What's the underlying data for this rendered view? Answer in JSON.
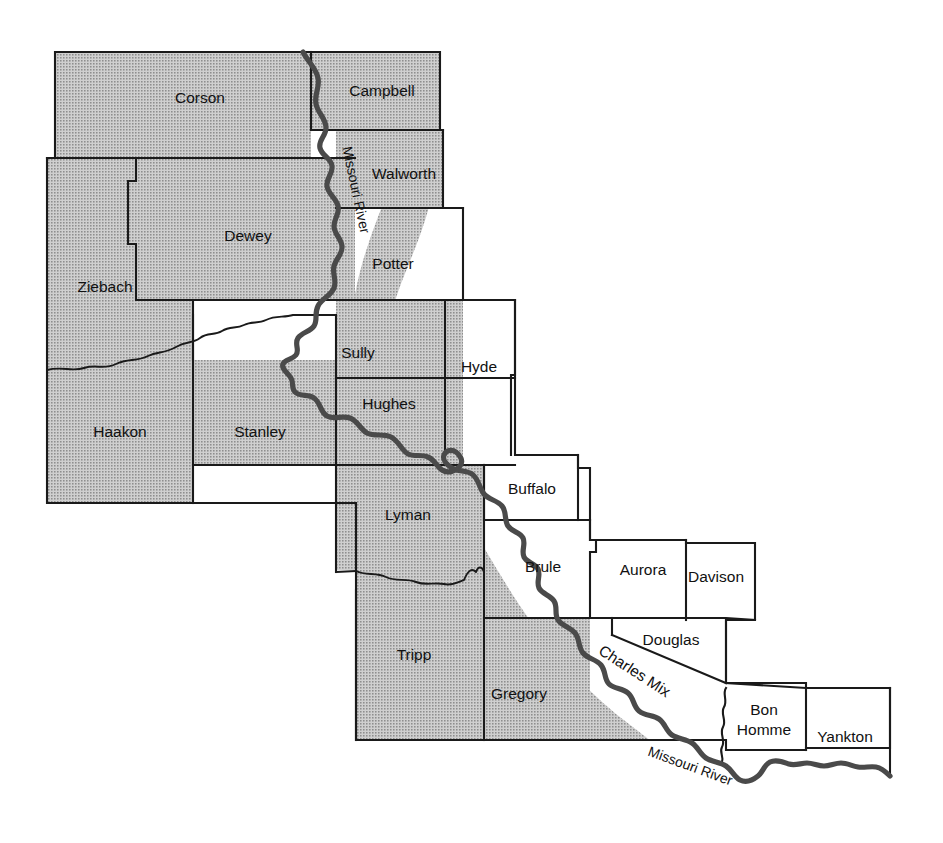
{
  "map": {
    "title": "Missouri River counties of South Dakota",
    "background_color": "#ffffff",
    "outline_color": "#1a1a1a",
    "shaded_region_color": "#b0b0b0",
    "river_color": "#4a4a4a",
    "shaded_region_name": "shaded study area",
    "counties": [
      {
        "id": "corson",
        "label": "Corson",
        "shaded": true,
        "x": 200,
        "y": 99
      },
      {
        "id": "campbell",
        "label": "Campbell",
        "shaded": true,
        "x": 382,
        "y": 92
      },
      {
        "id": "walworth",
        "label": "Walworth",
        "shaded": true,
        "x": 404,
        "y": 175
      },
      {
        "id": "dewey",
        "label": "Dewey",
        "shaded": true,
        "x": 248,
        "y": 237
      },
      {
        "id": "ziebach",
        "label": "Ziebach",
        "shaded": true,
        "x": 105,
        "y": 288
      },
      {
        "id": "potter",
        "label": "Potter",
        "shaded": false,
        "x": 393,
        "y": 265
      },
      {
        "id": "sully",
        "label": "Sully",
        "shaded": true,
        "x": 358,
        "y": 354
      },
      {
        "id": "hyde",
        "label": "Hyde",
        "shaded": false,
        "x": 479,
        "y": 368
      },
      {
        "id": "hughes",
        "label": "Hughes",
        "shaded": true,
        "x": 389,
        "y": 405
      },
      {
        "id": "haakon",
        "label": "Haakon",
        "shaded": true,
        "x": 120,
        "y": 433
      },
      {
        "id": "stanley",
        "label": "Stanley",
        "shaded": true,
        "x": 260,
        "y": 433
      },
      {
        "id": "buffalo",
        "label": "Buffalo",
        "shaded": false,
        "x": 532,
        "y": 490
      },
      {
        "id": "lyman",
        "label": "Lyman",
        "shaded": true,
        "x": 408,
        "y": 516
      },
      {
        "id": "brule",
        "label": "Brule",
        "shaded": false,
        "x": 543,
        "y": 568
      },
      {
        "id": "aurora",
        "label": "Aurora",
        "shaded": false,
        "x": 643,
        "y": 571
      },
      {
        "id": "davison",
        "label": "Davison",
        "shaded": false,
        "x": 716,
        "y": 578
      },
      {
        "id": "douglas",
        "label": "Douglas",
        "shaded": false,
        "x": 671,
        "y": 641
      },
      {
        "id": "tripp",
        "label": "Tripp",
        "shaded": true,
        "x": 414,
        "y": 656
      },
      {
        "id": "gregory",
        "label": "Gregory",
        "shaded": true,
        "x": 519,
        "y": 695
      },
      {
        "id": "charlesmix",
        "label": "Charles Mix",
        "shaded": false,
        "x": 634,
        "y": 672,
        "rotate": 33
      },
      {
        "id": "bonhomme",
        "label": "Bon",
        "label2": "Homme",
        "shaded": false,
        "x": 764,
        "y": 720
      },
      {
        "id": "yankton",
        "label": "Yankton",
        "shaded": false,
        "x": 845,
        "y": 738
      }
    ],
    "river_labels": [
      {
        "id": "missouri-river-north",
        "label": "Missouri River",
        "x": 355,
        "y": 190,
        "rotate": 78
      },
      {
        "id": "missouri-river-south",
        "label": "Missouri River",
        "x": 690,
        "y": 767,
        "rotate": 20
      }
    ]
  }
}
